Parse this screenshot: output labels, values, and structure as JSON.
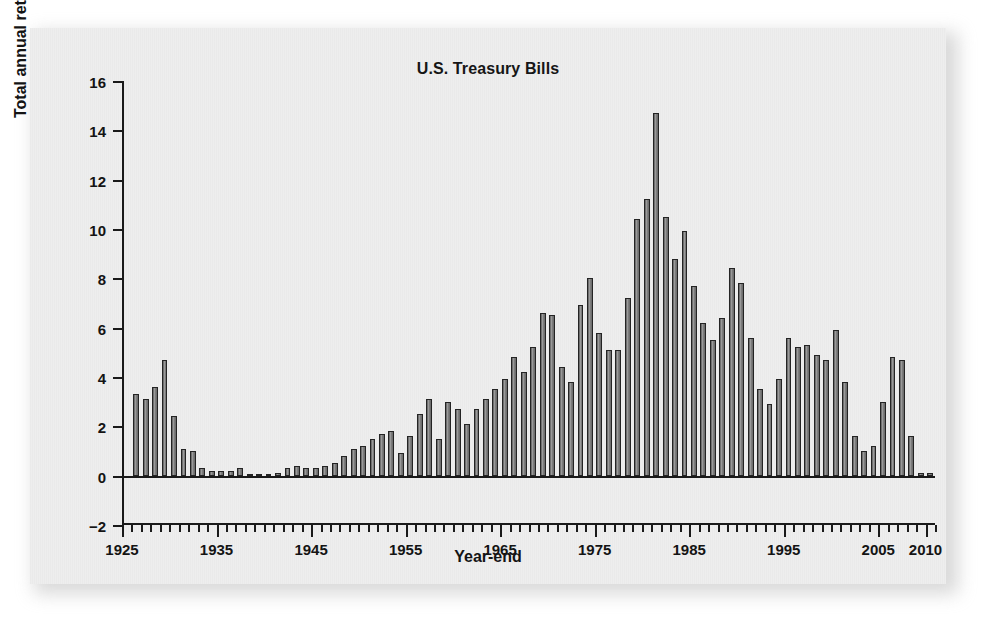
{
  "figure": {
    "title": "U.S. Treasury Bills",
    "xlabel": "Year-end",
    "ylabel": "Total annual returns (in percent)"
  },
  "colors": {
    "paper": "#eeeeee",
    "ink": "#1a1a1a",
    "bar_fill": "#8a8a8a",
    "bar_stroke": "#242424"
  },
  "chart_data": {
    "type": "bar",
    "title": "U.S. Treasury Bills",
    "xlabel": "Year-end",
    "ylabel": "Total annual returns (in percent)",
    "ylim": [
      -2,
      16
    ],
    "xlim": [
      1925,
      2011
    ],
    "ytick_labels": [
      "16",
      "14",
      "12",
      "10",
      "8",
      "6",
      "4",
      "2",
      "0",
      "−2"
    ],
    "ytick_values": [
      16,
      14,
      12,
      10,
      8,
      6,
      4,
      2,
      0,
      -2
    ],
    "xtick_labels": [
      "1925",
      "1935",
      "1945",
      "1955",
      "1965",
      "1975",
      "1985",
      "1995",
      "2005",
      "2010"
    ],
    "xtick_values": [
      1925,
      1935,
      1945,
      1955,
      1965,
      1975,
      1985,
      1995,
      2005,
      2010
    ],
    "grid": false,
    "legend": null,
    "series_name": "Total annual return",
    "categories": [
      1926,
      1927,
      1928,
      1929,
      1930,
      1931,
      1932,
      1933,
      1934,
      1935,
      1936,
      1937,
      1938,
      1939,
      1940,
      1941,
      1942,
      1943,
      1944,
      1945,
      1946,
      1947,
      1948,
      1949,
      1950,
      1951,
      1952,
      1953,
      1954,
      1955,
      1956,
      1957,
      1958,
      1959,
      1960,
      1961,
      1962,
      1963,
      1964,
      1965,
      1966,
      1967,
      1968,
      1969,
      1970,
      1971,
      1972,
      1973,
      1974,
      1975,
      1976,
      1977,
      1978,
      1979,
      1980,
      1981,
      1982,
      1983,
      1984,
      1985,
      1986,
      1987,
      1988,
      1989,
      1990,
      1991,
      1992,
      1993,
      1994,
      1995,
      1996,
      1997,
      1998,
      1999,
      2000,
      2001,
      2002,
      2003,
      2004,
      2005,
      2006,
      2007,
      2008,
      2009,
      2010
    ],
    "values": [
      3.3,
      3.1,
      3.6,
      4.7,
      2.4,
      1.1,
      1.0,
      0.3,
      0.2,
      0.2,
      0.2,
      0.3,
      0.0,
      0.0,
      0.0,
      0.1,
      0.3,
      0.4,
      0.3,
      0.3,
      0.4,
      0.5,
      0.8,
      1.1,
      1.2,
      1.5,
      1.7,
      1.8,
      0.9,
      1.6,
      2.5,
      3.1,
      1.5,
      3.0,
      2.7,
      2.1,
      2.7,
      3.1,
      3.5,
      3.9,
      4.8,
      4.2,
      5.2,
      6.6,
      6.5,
      4.4,
      3.8,
      6.9,
      8.0,
      5.8,
      5.1,
      5.1,
      7.2,
      10.4,
      11.2,
      14.7,
      10.5,
      8.8,
      9.9,
      7.7,
      6.2,
      5.5,
      6.4,
      8.4,
      7.8,
      5.6,
      3.5,
      2.9,
      3.9,
      5.6,
      5.2,
      5.3,
      4.9,
      4.7,
      5.9,
      3.8,
      1.6,
      1.0,
      1.2,
      3.0,
      4.8,
      4.7,
      1.6,
      0.1,
      0.1
    ]
  },
  "axis": {
    "y_ticks": [
      {
        "label": "16",
        "value": 16
      },
      {
        "label": "14",
        "value": 14
      },
      {
        "label": "12",
        "value": 12
      },
      {
        "label": "10",
        "value": 10
      },
      {
        "label": "8",
        "value": 8
      },
      {
        "label": "6",
        "value": 6
      },
      {
        "label": "4",
        "value": 4
      },
      {
        "label": "2",
        "value": 2
      },
      {
        "label": "0",
        "value": 0
      },
      {
        "label": "−2",
        "value": -2
      }
    ],
    "x_ticks": [
      {
        "label": "1925",
        "value": 1925
      },
      {
        "label": "1935",
        "value": 1935
      },
      {
        "label": "1945",
        "value": 1945
      },
      {
        "label": "1955",
        "value": 1955
      },
      {
        "label": "1965",
        "value": 1965
      },
      {
        "label": "1975",
        "value": 1975
      },
      {
        "label": "1985",
        "value": 1985
      },
      {
        "label": "1995",
        "value": 1995
      },
      {
        "label": "2005",
        "value": 2005
      },
      {
        "label": "2010",
        "value": 2010
      }
    ]
  }
}
